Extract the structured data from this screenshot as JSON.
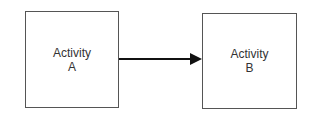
{
  "diagram": {
    "nodes": [
      {
        "id": "A",
        "line1": "Activity",
        "line2": "A"
      },
      {
        "id": "B",
        "line1": "Activity",
        "line2": "B"
      }
    ],
    "edges": [
      {
        "from": "A",
        "to": "B",
        "type": "arrow"
      }
    ]
  }
}
